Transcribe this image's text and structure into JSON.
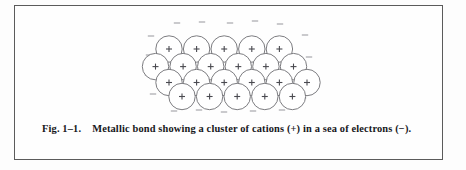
{
  "figure": {
    "border_color": "#5b5b5b",
    "background": "#fefefe"
  },
  "caption": {
    "label": "Fig. 1–1.",
    "text": "Metallic bond showing a cluster of cations (+) in a sea of electrons (−)."
  },
  "diagram": {
    "name": "metallic-bond-lattice",
    "cation_symbol": "+",
    "electron_symbol": "−",
    "circle_stroke": "#6d6d72",
    "circle_fill": "#ffffff",
    "symbol_color": "#4a4a50",
    "electron_color": "#b9b9bd",
    "radius": 13.2,
    "rows": [
      {
        "row": 1,
        "count": 5,
        "y": 48.0,
        "x_start": 168.0,
        "x_step": 27.6
      },
      {
        "row": 2,
        "count": 6,
        "y": 65.6,
        "x_start": 154.5,
        "x_step": 27.6
      },
      {
        "row": 3,
        "count": 6,
        "y": 81.5,
        "x_start": 168.0,
        "x_step": 27.6
      },
      {
        "row": 4,
        "count": 5,
        "y": 95.5,
        "x_start": 181.0,
        "x_step": 27.6
      }
    ],
    "electrons": [
      {
        "x": 176,
        "y": 22
      },
      {
        "x": 201,
        "y": 21
      },
      {
        "x": 229,
        "y": 22
      },
      {
        "x": 254,
        "y": 20
      },
      {
        "x": 279,
        "y": 23
      },
      {
        "x": 150,
        "y": 35
      },
      {
        "x": 148,
        "y": 54
      },
      {
        "x": 147,
        "y": 74
      },
      {
        "x": 152,
        "y": 93
      },
      {
        "x": 304,
        "y": 34
      },
      {
        "x": 308,
        "y": 56
      },
      {
        "x": 306,
        "y": 77
      },
      {
        "x": 302,
        "y": 97
      },
      {
        "x": 173,
        "y": 110
      },
      {
        "x": 198,
        "y": 109
      },
      {
        "x": 223,
        "y": 111
      },
      {
        "x": 252,
        "y": 110
      },
      {
        "x": 281,
        "y": 109
      }
    ]
  }
}
